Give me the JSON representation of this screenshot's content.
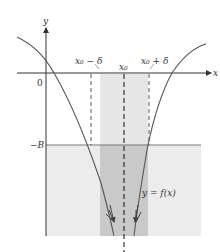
{
  "diagram": {
    "axes": {
      "x_label": "x",
      "y_label": "y",
      "origin_label": "0"
    },
    "labels": {
      "x0_minus_delta": "x₀ − δ",
      "x0": "x₀",
      "x0_plus_delta": "x₀ + δ",
      "neg_B": "−B",
      "curve": "y = f(x)"
    },
    "colors": {
      "background": "#ffffff",
      "axis": "#333333",
      "curve": "#555555",
      "light_fill": "#ececec",
      "band_fill": "#e2e2e2",
      "dark_band_fill": "#c8c8c8",
      "neg_B_line": "#777777",
      "dashed": "#444444"
    }
  }
}
